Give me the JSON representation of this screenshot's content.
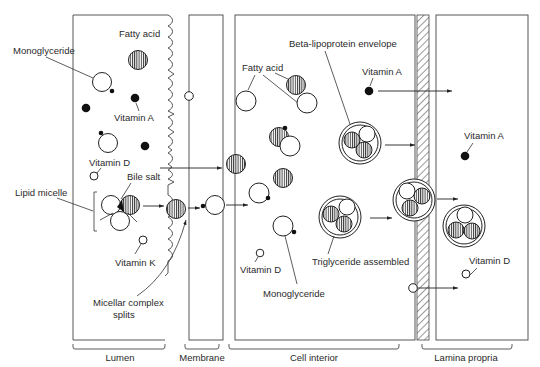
{
  "diagram": {
    "regions": [
      {
        "id": "lumen",
        "label": "Lumen"
      },
      {
        "id": "membrane",
        "label": "Membrane"
      },
      {
        "id": "cell-interior",
        "label": "Cell interior"
      },
      {
        "id": "lamina-propria",
        "label": "Lamina propria"
      }
    ],
    "labels": {
      "monoglyceride_lumen": "Monoglyceride",
      "fatty_acid_lumen": "Fatty acid",
      "vitamin_a_lumen": "Vitamin A",
      "vitamin_d_lumen": "Vitamin D",
      "lipid_micelle": "Lipid micelle",
      "bile_salt": "Bile salt",
      "vitamin_k": "Vitamin K",
      "micellar_complex_splits": "Micellar complex",
      "micellar_complex_splits_2": "splits",
      "fatty_acid_cell": "Fatty acid",
      "beta_lipoprotein_envelope": "Beta-lipoprotein envelope",
      "vitamin_a_cell": "Vitamin A",
      "vitamin_d_cell": "Vitamin D",
      "monoglyceride_cell": "Monoglyceride",
      "triglyceride_assembled": "Triglyceride assembled",
      "vitamin_a_lamina": "Vitamin A",
      "vitamin_d_lamina": "Vitamin D"
    },
    "legend_symbols": {
      "fatty_acid": "vertically striped circle",
      "monoglyceride": "open circle with black dot",
      "vitamin_a": "solid black dot",
      "vitamin_d": "small open circle",
      "vitamin_k": "small open circle",
      "triglyceride": "three-circle cluster",
      "chylomicron": "triglyceride cluster in double-ring envelope"
    }
  }
}
